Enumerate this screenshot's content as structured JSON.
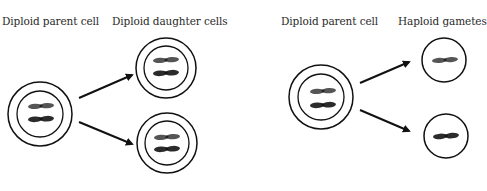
{
  "mitosis": {
    "parent_label": "Diploid parent cell",
    "daughter_label": "Diploid daughter cells"
  },
  "meiosis": {
    "parent_label": "Diploid parent cell",
    "gamete_label": "Haploid gametes"
  },
  "colors": {
    "outline": "#111111",
    "chromosome_light": "#555555",
    "chromosome_dark": "#2b2b2b",
    "arrow": "#111111"
  }
}
